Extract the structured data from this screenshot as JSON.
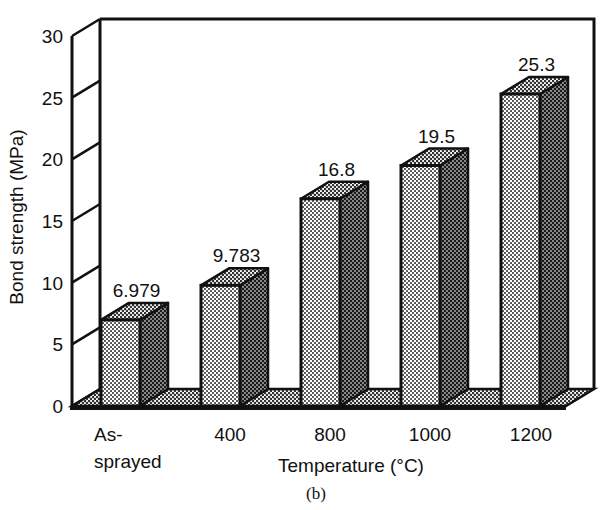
{
  "chart_data": {
    "type": "bar",
    "style": "3d",
    "title": "",
    "caption": "(b)",
    "xlabel": "Temperature (°C)",
    "ylabel": "Bond strength (MPa)",
    "categories": [
      "As-sprayed",
      "400",
      "800",
      "1000",
      "1200"
    ],
    "category_lines": [
      [
        "As-",
        "sprayed"
      ],
      [
        "400"
      ],
      [
        "800"
      ],
      [
        "1000"
      ],
      [
        "1200"
      ]
    ],
    "values": [
      6.979,
      9.783,
      16.8,
      19.5,
      25.3
    ],
    "value_labels": [
      "6.979",
      "9.783",
      "16.8",
      "19.5",
      "25.3"
    ],
    "ylim": [
      0,
      30
    ],
    "yticks": [
      0,
      5,
      10,
      15,
      20,
      25,
      30
    ],
    "grid": false,
    "legend": null
  },
  "colors": {
    "outline": "#111111",
    "front_face": "#bdbdbd",
    "side_face": "#3a3a3a",
    "top_face": "#7a7a7a",
    "floor": "#c8c8c8"
  }
}
